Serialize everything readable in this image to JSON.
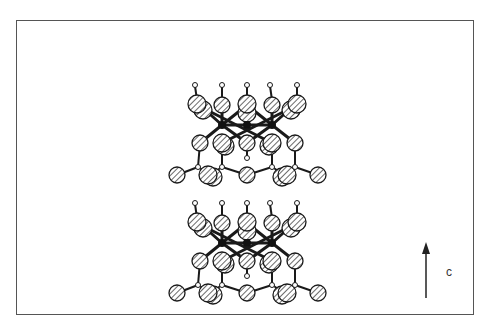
{
  "figure": {
    "axis_label": "c",
    "colors": {
      "frame": "#555555",
      "atom_fill": "#ffffff",
      "atom_hatch": "#444444",
      "bond": "#1a1a1a",
      "center_atom": "#111111"
    },
    "layers": 2
  }
}
